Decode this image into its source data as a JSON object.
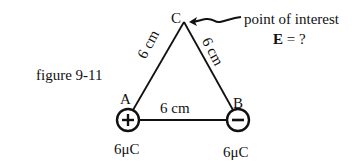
{
  "figure": {
    "caption": "figure 9-11",
    "annotation": {
      "line1": "point of interest",
      "line2_bold": "E",
      "line2_rest": " = ?"
    },
    "vertices": {
      "A": "A",
      "B": "B",
      "C": "C"
    },
    "sides": {
      "AC": "6 cm",
      "BC": "6 cm",
      "AB": "6 cm"
    },
    "charges": {
      "A": {
        "sign": "+",
        "value": "6μC"
      },
      "B": {
        "sign": "−",
        "value": "6μC"
      }
    },
    "colors": {
      "ink": "#111111",
      "background": "#ffffff"
    }
  }
}
